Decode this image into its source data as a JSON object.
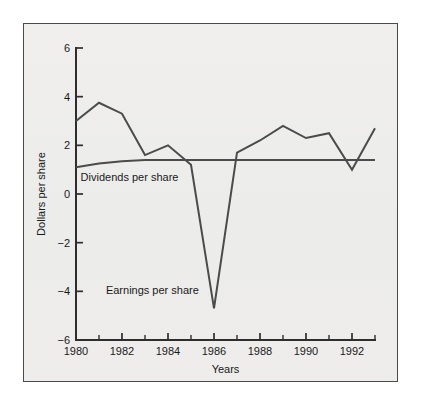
{
  "figure": {
    "background_color": "#eeeeec",
    "page_color": "#ffffff",
    "border_color": "#4a4a4a",
    "line_color": "#4b4b4b",
    "axis_color": "#2e2e2e"
  },
  "chart_data": {
    "type": "line",
    "title": "",
    "subtitle": "",
    "xlabel": "Years",
    "ylabel": "Dollars per share",
    "xlim": [
      1980,
      1993
    ],
    "ylim": [
      -6,
      6
    ],
    "grid": false,
    "legend_position": "inline-annotations",
    "x": [
      1980,
      1981,
      1982,
      1983,
      1984,
      1985,
      1986,
      1987,
      1988,
      1989,
      1990,
      1991,
      1992,
      1993
    ],
    "y_ticks": [
      6,
      4,
      2,
      0,
      -2,
      -4,
      -6
    ],
    "y_tick_labels": [
      "6",
      "4",
      "2",
      "0",
      "-2",
      "-4",
      "-6"
    ],
    "x_ticks_major": [
      1980,
      1982,
      1984,
      1986,
      1988,
      1990,
      1992
    ],
    "x_tick_labels": [
      "1980",
      "1982",
      "1984",
      "1986",
      "1988",
      "1990",
      "1992"
    ],
    "x_ticks_minor": [
      1981,
      1983,
      1985,
      1987,
      1989,
      1991,
      1993
    ],
    "series": [
      {
        "name": "Earnings per share",
        "annotation": "Earnings per share",
        "annotation_x": 1981.3,
        "annotation_y": -4.1,
        "values": [
          3.0,
          3.75,
          3.3,
          1.6,
          2.0,
          1.2,
          -4.7,
          1.7,
          2.2,
          2.8,
          2.3,
          2.5,
          1.0,
          2.7
        ]
      },
      {
        "name": "Dividends per share",
        "annotation": "Dividends per share",
        "annotation_x": 1980.2,
        "annotation_y": 0.55,
        "values": [
          1.1,
          1.25,
          1.35,
          1.4,
          1.4,
          1.4,
          1.4,
          1.4,
          1.4,
          1.4,
          1.4,
          1.4,
          1.4,
          1.4
        ]
      }
    ]
  }
}
